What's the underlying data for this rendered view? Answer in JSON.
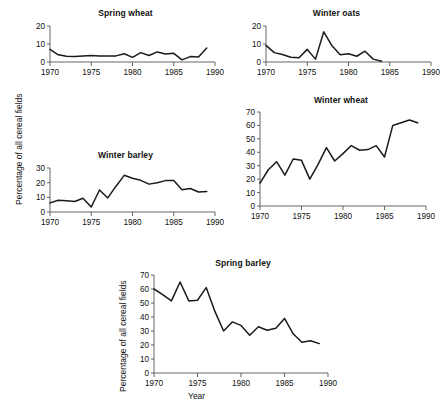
{
  "figure": {
    "shared_ylabel": "Percentage of all cereal fields",
    "xlabel": "Year"
  },
  "chart_data": [
    {
      "type": "line",
      "title": "Spring wheat",
      "xlabel": "",
      "ylabel": "Percentage of all cereal fields",
      "xlim": [
        1970,
        1990
      ],
      "ylim": [
        0,
        20
      ],
      "yticks": [
        0,
        10,
        20
      ],
      "xticks": [
        1970,
        1975,
        1980,
        1985,
        1990
      ],
      "grid": false,
      "legend": "none",
      "x": [
        1970,
        1971,
        1972,
        1973,
        1974,
        1975,
        1976,
        1977,
        1978,
        1979,
        1980,
        1981,
        1982,
        1983,
        1984,
        1985,
        1986,
        1987,
        1988,
        1989
      ],
      "values": [
        7.0,
        4.0,
        3.2,
        3.0,
        3.4,
        3.6,
        3.4,
        3.3,
        3.4,
        4.6,
        2.6,
        5.2,
        3.6,
        5.6,
        4.4,
        4.8,
        1.2,
        3.0,
        2.8,
        7.8
      ]
    },
    {
      "type": "line",
      "title": "Winter oats",
      "xlabel": "",
      "ylabel": "Percentage of all cereal fields",
      "xlim": [
        1970,
        1990
      ],
      "ylim": [
        0,
        20
      ],
      "yticks": [
        0,
        10,
        20
      ],
      "xticks": [
        1970,
        1975,
        1980,
        1985,
        1990
      ],
      "grid": false,
      "legend": "none",
      "x": [
        1970,
        1971,
        1972,
        1973,
        1974,
        1975,
        1976,
        1977,
        1978,
        1979,
        1980,
        1981,
        1982,
        1983,
        1984
      ],
      "values": [
        9.2,
        5.2,
        4.2,
        2.6,
        2.4,
        7.0,
        1.6,
        16.8,
        9.0,
        4.0,
        4.6,
        3.2,
        6.0,
        1.6,
        0.4
      ]
    },
    {
      "type": "line",
      "title": "Winter barley",
      "xlabel": "",
      "ylabel": "Percentage of all cereal fields",
      "xlim": [
        1970,
        1990
      ],
      "ylim": [
        0,
        30
      ],
      "yticks": [
        0,
        10,
        20,
        30
      ],
      "xticks": [
        1970,
        1975,
        1980,
        1985,
        1990
      ],
      "grid": false,
      "legend": "none",
      "x": [
        1970,
        1971,
        1972,
        1973,
        1974,
        1975,
        1976,
        1977,
        1978,
        1979,
        1980,
        1981,
        1982,
        1983,
        1984,
        1985,
        1986,
        1987,
        1988,
        1989
      ],
      "values": [
        6.2,
        8.0,
        7.6,
        7.2,
        9.4,
        3.4,
        15.0,
        9.6,
        17.6,
        25.0,
        23.0,
        21.6,
        19.0,
        20.0,
        21.4,
        21.4,
        15.2,
        16.0,
        13.6,
        14.0
      ]
    },
    {
      "type": "line",
      "title": "Winter wheat",
      "xlabel": "",
      "ylabel": "Percentage of all cereal fields",
      "xlim": [
        1970,
        1990
      ],
      "ylim": [
        0,
        70
      ],
      "yticks": [
        0,
        10,
        20,
        30,
        40,
        50,
        60,
        70
      ],
      "xticks": [
        1970,
        1975,
        1980,
        1985,
        1990
      ],
      "grid": false,
      "legend": "none",
      "x": [
        1970,
        1971,
        1972,
        1973,
        1974,
        1975,
        1976,
        1977,
        1978,
        1979,
        1980,
        1981,
        1982,
        1983,
        1984,
        1985,
        1986,
        1987,
        1988,
        1989
      ],
      "values": [
        17.0,
        27.0,
        33.0,
        23.0,
        35.0,
        34.0,
        20.0,
        31.0,
        43.5,
        33.5,
        39.0,
        45.0,
        41.5,
        42.0,
        45.0,
        36.5,
        60.0,
        62.0,
        64.0,
        62.0
      ]
    },
    {
      "type": "line",
      "title": "Spring barley",
      "xlabel": "Year",
      "ylabel": "Percentage of all cereal fields",
      "xlim": [
        1970,
        1990
      ],
      "ylim": [
        0,
        70
      ],
      "yticks": [
        0,
        10,
        20,
        30,
        40,
        50,
        60,
        70
      ],
      "xticks": [
        1970,
        1975,
        1980,
        1985,
        1990
      ],
      "grid": false,
      "legend": "none",
      "x": [
        1970,
        1971,
        1972,
        1973,
        1974,
        1975,
        1976,
        1977,
        1978,
        1979,
        1980,
        1981,
        1982,
        1983,
        1984,
        1985,
        1986,
        1987,
        1988,
        1989
      ],
      "values": [
        60.0,
        56.0,
        51.5,
        65.0,
        51.5,
        52.0,
        61.0,
        44.0,
        30.0,
        36.5,
        34.0,
        27.0,
        33.0,
        30.5,
        32.0,
        39.0,
        28.0,
        22.0,
        23.0,
        21.0
      ]
    }
  ]
}
